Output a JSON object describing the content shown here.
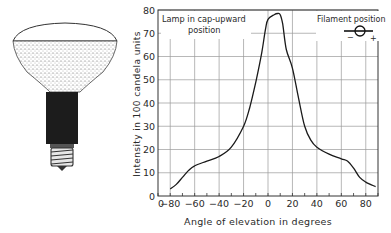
{
  "illustration": {
    "subject": "reflector lamp (bulb with frosted dome, dark neck and screw cap)"
  },
  "chart_data": {
    "type": "line",
    "title": "",
    "xlabel": "Angle of elevation in degrees",
    "ylabel": "Intensity in 100 candela units",
    "xlim": [
      -90,
      90
    ],
    "ylim": [
      0,
      80
    ],
    "x_ticks": [
      -80,
      -60,
      -40,
      -20,
      0,
      20,
      40,
      60,
      80
    ],
    "y_ticks": [
      0,
      10,
      20,
      30,
      40,
      50,
      60,
      70,
      80
    ],
    "x_tick_labels": [
      "0",
      "-80",
      "-60",
      "-40",
      "-20",
      "0",
      "20",
      "40",
      "60",
      "80"
    ],
    "y_tick_labels": [
      "0",
      "10",
      "20",
      "30",
      "40",
      "50",
      "60",
      "70",
      "80"
    ],
    "grid": true,
    "annotations": [
      {
        "text_line1": "Lamp in cap-upward",
        "text_line2": "position",
        "position": "top-left"
      },
      {
        "text": "Filament position",
        "symbol": "circle on horizontal line with - left and + right",
        "position": "top-right"
      }
    ],
    "series": [
      {
        "name": "Intensity",
        "x": [
          -80,
          -75,
          -70,
          -65,
          -60,
          -50,
          -40,
          -30,
          -20,
          -15,
          -10,
          -5,
          -2,
          0,
          5,
          8,
          10,
          12,
          15,
          20,
          25,
          30,
          35,
          40,
          50,
          60,
          65,
          70,
          75,
          80,
          88
        ],
        "values": [
          3,
          5,
          8,
          11,
          13,
          15,
          17,
          21,
          30,
          38,
          49,
          62,
          72,
          76,
          78,
          78.5,
          78,
          74,
          63,
          55,
          42,
          30,
          24,
          21,
          18,
          16,
          15,
          12,
          8,
          6,
          4
        ]
      }
    ]
  },
  "labels": {
    "annotation_left_line1": "Lamp in cap-upward",
    "annotation_left_line2": "position",
    "annotation_right": "Filament position",
    "filament_minus": "−",
    "filament_plus": "+",
    "xlabel": "Angle of elevation in degrees",
    "ylabel": "Intensity in 100 candela units"
  }
}
